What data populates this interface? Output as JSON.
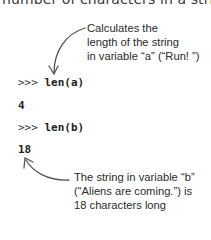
{
  "heading": {
    "partial_text": "number of characters in a string."
  },
  "annotations": {
    "a": {
      "lines": [
        "Calculates the",
        "length of the string",
        "in variable “a” (“Run! ”)"
      ]
    },
    "b": {
      "lines": [
        "The string in variable “b”",
        "(“Aliens are coming.”) is",
        "18 characters long"
      ]
    }
  },
  "session": {
    "lines": [
      {
        "prompt": ">>> ",
        "command": "len(a)"
      },
      {
        "output": "4"
      },
      {
        "prompt": ">>> ",
        "command": "len(b)"
      },
      {
        "output": "18"
      }
    ]
  },
  "icons": {
    "arrow_a": "curved-arrow-down-icon",
    "arrow_b": "curved-arrow-up-left-icon"
  },
  "colors": {
    "text": "#231f20",
    "arrow": "#555555",
    "background": "#ffffff"
  }
}
